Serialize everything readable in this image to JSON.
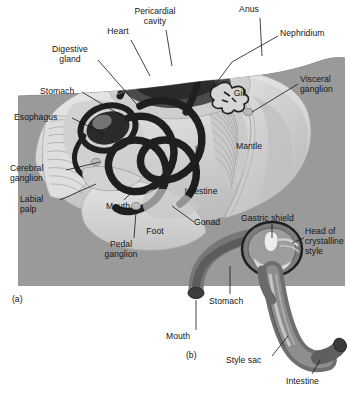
{
  "figure": {
    "panels": [
      {
        "tag": "(a)",
        "name": "whole-body-anatomy"
      },
      {
        "tag": "(b)",
        "name": "stomach-and-crystalline-style-detail"
      }
    ],
    "background_color": "#ffffff",
    "panel_a_background_color": "#9a9a9a",
    "ink_color": "#151515",
    "organ_dark_color": "#1f1f1f",
    "organ_mid_color": "#6f6f6f",
    "organ_light_color": "#d8d8d8"
  },
  "panel_a": {
    "tag": "(a)",
    "labels": [
      {
        "id": "pericardial-cavity",
        "text": "Pericardial\ncavity",
        "x": 155,
        "y": 8,
        "align": "ctr"
      },
      {
        "id": "anus",
        "text": "Anus",
        "x": 248,
        "y": 6,
        "align": "ctr"
      },
      {
        "id": "heart",
        "text": "Heart",
        "x": 117,
        "y": 28,
        "align": "ctr"
      },
      {
        "id": "nephridium",
        "text": "Nephridium",
        "x": 280,
        "y": 30,
        "align": "left"
      },
      {
        "id": "digestive-gland",
        "text": "Digestive\ngland",
        "x": 68,
        "y": 46,
        "align": "ctr"
      },
      {
        "id": "visceral-ganglion",
        "text": "Visceral\nganglion",
        "x": 300,
        "y": 77,
        "align": "left"
      },
      {
        "id": "stomach",
        "text": "Stomach",
        "x": 42,
        "y": 88,
        "align": "left"
      },
      {
        "id": "gill",
        "text": "Gill",
        "x": 238,
        "y": 90,
        "align": "ctr"
      },
      {
        "id": "esophagus",
        "text": "Esophagus",
        "x": 16,
        "y": 114,
        "align": "left"
      },
      {
        "id": "mantle",
        "text": "Mantle",
        "x": 246,
        "y": 143,
        "align": "ctr"
      },
      {
        "id": "cerebral-ganglion",
        "text": "Cerebral\nganglion",
        "x": 12,
        "y": 165,
        "align": "left"
      },
      {
        "id": "intestine",
        "text": "Intestine",
        "x": 198,
        "y": 188,
        "align": "ctr"
      },
      {
        "id": "labial-palp",
        "text": "Labial\npalp",
        "x": 22,
        "y": 196,
        "align": "left"
      },
      {
        "id": "mouth",
        "text": "Mouth",
        "x": 108,
        "y": 203,
        "align": "left"
      },
      {
        "id": "gonad",
        "text": "Gonad",
        "x": 196,
        "y": 219,
        "align": "left"
      },
      {
        "id": "foot",
        "text": "Foot",
        "x": 155,
        "y": 228,
        "align": "ctr"
      },
      {
        "id": "pedal-ganglion",
        "text": "Pedal\nganglion",
        "x": 120,
        "y": 241,
        "align": "ctr"
      }
    ]
  },
  "panel_b": {
    "tag": "(b)",
    "labels": [
      {
        "id": "gastric-shield",
        "text": "Gastric shield",
        "x": 243,
        "y": 215,
        "align": "left"
      },
      {
        "id": "head-of-crystalline-style",
        "text": "Head of\ncrystalline\nstyle",
        "x": 306,
        "y": 228,
        "align": "left"
      },
      {
        "id": "stomach-b",
        "text": "Stomach",
        "x": 211,
        "y": 298,
        "align": "left"
      },
      {
        "id": "mouth-b",
        "text": "Mouth",
        "x": 168,
        "y": 333,
        "align": "left"
      },
      {
        "id": "style-sac",
        "text": "Style sac",
        "x": 228,
        "y": 357,
        "align": "left"
      },
      {
        "id": "intestine-b",
        "text": "Intestine",
        "x": 288,
        "y": 378,
        "align": "left"
      }
    ]
  }
}
